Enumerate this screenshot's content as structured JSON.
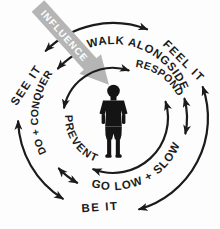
{
  "diagram": {
    "title_concept": "INFLUENCE",
    "center": "child-silhouette",
    "colors": {
      "background": "#fdfdfd",
      "ink": "#1b1b1b",
      "influence_gray": "#b5b5b5",
      "influence_text": "#ffffff"
    },
    "influence": {
      "label": "INFLUENCE"
    },
    "rings": {
      "inner": {
        "respond": "RESPOND",
        "prevent": "PREVENT"
      },
      "middle": {
        "walk_alongside": "WALK ALONGSIDE",
        "go_low_slow": "GO LOW + SLOW",
        "do_conquer": "DO + CONQUER"
      },
      "outer": {
        "feel_it": "FEEL IT",
        "see_it": "SEE IT",
        "be_it": "BE IT"
      }
    }
  }
}
